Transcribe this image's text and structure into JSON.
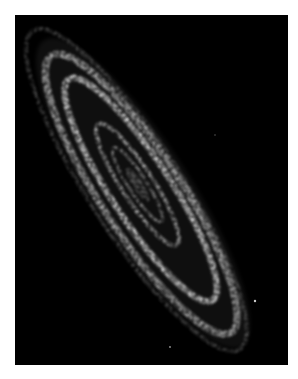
{
  "image": {
    "subject": "spiral galaxy viewed at a steep inclination, infrared dust-emission view",
    "description": "Grayscale image of an elongated spiral galaxy with bright dusty rings, oriented diagonally from upper-left to lower-right on a black background, surrounded by a thin white margin",
    "background_color": "#000000",
    "margin_color": "#ffffff",
    "ring_color": "#e6e6e6"
  }
}
